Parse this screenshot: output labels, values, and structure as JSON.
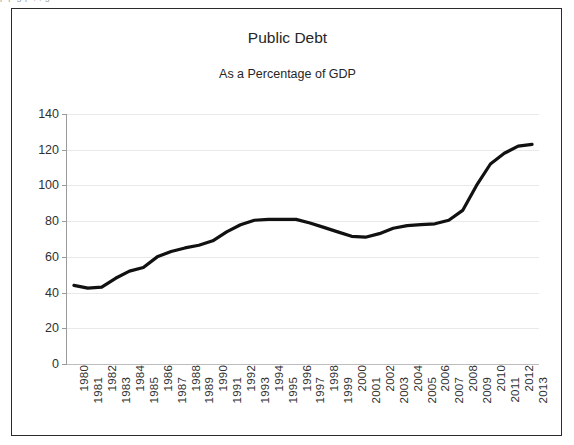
{
  "scan_artifact": {
    "text": "p  p       g              p ,         ,                                 g"
  },
  "figure": {
    "title": "Public Debt",
    "subtitle": "As a Percentage of GDP"
  },
  "chart_data": {
    "type": "line",
    "title": "Public Debt",
    "subtitle": "As a Percentage of GDP",
    "xlabel": "",
    "ylabel": "",
    "ylim": [
      0,
      140
    ],
    "yticks": [
      0,
      20,
      40,
      60,
      80,
      100,
      120,
      140
    ],
    "grid": true,
    "legend": "none",
    "line_color": "#111111",
    "line_width": 3.2,
    "categories": [
      "1980",
      "1981",
      "1982",
      "1983",
      "1984",
      "1985",
      "1986",
      "1987",
      "1988",
      "1989",
      "1990",
      "1991",
      "1992",
      "1993",
      "1994",
      "1995",
      "1996",
      "1997",
      "1998",
      "1999",
      "2000",
      "2001",
      "2002",
      "2003",
      "2004",
      "2005",
      "2006",
      "2007",
      "2008",
      "2009",
      "2010",
      "2011",
      "2012",
      "2013"
    ],
    "values": [
      44,
      42.5,
      43,
      48,
      52,
      54,
      60,
      63,
      65,
      66.5,
      69,
      74,
      78,
      80.5,
      81,
      81,
      81,
      79,
      76.5,
      74,
      71.5,
      71,
      73,
      76,
      77.5,
      78,
      78.5,
      80.5,
      86,
      100,
      112,
      118,
      122,
      123
    ]
  }
}
